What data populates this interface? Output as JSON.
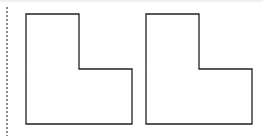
{
  "diagram": {
    "title": "",
    "stroke_color": "#222222",
    "fill_color": "#ffffff",
    "divider": {
      "style": "dotted",
      "color": "#8a8a8a"
    },
    "shapes": [
      {
        "name": "l-shape-left",
        "type": "L-shape",
        "points": "26,14 79,14 79,69 132,69 132,124 26,124"
      },
      {
        "name": "l-shape-right",
        "type": "L-shape",
        "points": "146,14 199,14 199,69 252,69 252,124 146,124"
      }
    ]
  }
}
